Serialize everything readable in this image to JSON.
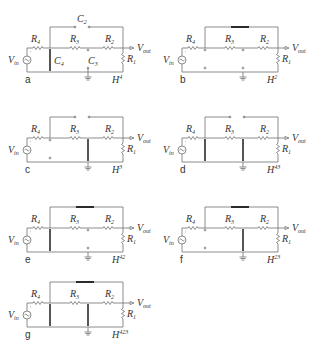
{
  "figure": {
    "colors": {
      "wire": "#6f6f6f",
      "short": "#2b2b2b",
      "text": "#333333",
      "background": "#ffffff"
    },
    "common_labels": {
      "source": "V",
      "source_sub": "in",
      "output": "V",
      "output_sub": "out",
      "R4": "R",
      "R4_sub": "4",
      "R3": "R",
      "R3_sub": "3",
      "R2": "R",
      "R2_sub": "2",
      "R1": "R",
      "R1_sub": "1",
      "transfer": "H",
      "plus": "+"
    },
    "panels": [
      {
        "id": "a",
        "tag": "a",
        "H_sup": "4",
        "C2": "C",
        "C2_sub": "2",
        "C4": "C",
        "C4_sub": "4",
        "C3": "C",
        "C3_sub": "3"
      },
      {
        "id": "b",
        "tag": "b",
        "H_sup": "2"
      },
      {
        "id": "c",
        "tag": "c",
        "H_sup": "3"
      },
      {
        "id": "d",
        "tag": "d",
        "H_sup": "43"
      },
      {
        "id": "e",
        "tag": "e",
        "H_sup": "42"
      },
      {
        "id": "f",
        "tag": "f",
        "H_sup": "23"
      },
      {
        "id": "g",
        "tag": "g",
        "H_sup": "423"
      }
    ]
  }
}
